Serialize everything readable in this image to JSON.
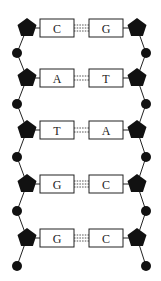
{
  "diagram": {
    "pairs": [
      {
        "left": "C",
        "right": "G",
        "hbonds": 3
      },
      {
        "left": "A",
        "right": "T",
        "hbonds": 2
      },
      {
        "left": "T",
        "right": "A",
        "hbonds": 2
      },
      {
        "left": "G",
        "right": "C",
        "hbonds": 3
      },
      {
        "left": "G",
        "right": "C",
        "hbonds": 3
      }
    ],
    "colors": {
      "stroke": "#222222",
      "fill": "#111111",
      "background": "#ffffff"
    }
  }
}
